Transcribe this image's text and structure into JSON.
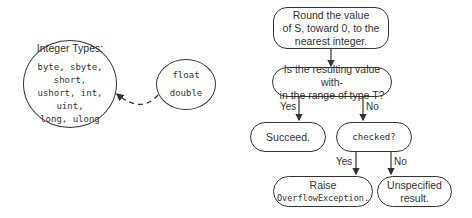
{
  "left_diagram": {
    "integer_circle": {
      "title": "Integer Types:",
      "lines": [
        "byte, sbyte, short,",
        "ushort, int, uint,",
        "long, ulong"
      ]
    },
    "float_circle": {
      "lines": [
        "float",
        "double"
      ]
    }
  },
  "flowchart": {
    "round": {
      "lines": [
        "Round the value",
        "of S, toward 0, to the",
        "nearest integer."
      ]
    },
    "range_check": {
      "lines": [
        "Is the resulting value with-",
        "in the range of type T?"
      ]
    },
    "range_yes": "Yes",
    "range_no": "No",
    "succeed": "Succeed.",
    "checked": "checked?",
    "checked_yes": "Yes",
    "checked_no": "No",
    "raise": {
      "line1": "Raise",
      "line2": "OverflowException."
    },
    "unspecified": {
      "lines": [
        "Unspecified",
        "result."
      ]
    }
  },
  "colors": {
    "stroke": "#333333",
    "background": "#ffffff"
  }
}
